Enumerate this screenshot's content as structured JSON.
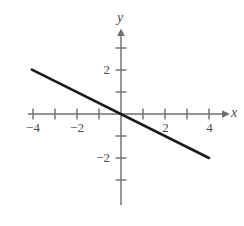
{
  "chart_data": {
    "type": "line",
    "title": "",
    "subtitle": "",
    "xlabel": "x",
    "ylabel": "y",
    "xlim": [
      -4.2,
      4.7
    ],
    "ylim": [
      -3.7,
      3.7
    ],
    "grid": false,
    "legend": null,
    "x_ticks": [
      -4,
      -3,
      -2,
      -1,
      1,
      2,
      3,
      4
    ],
    "x_tick_labels": [
      "−4",
      "",
      "−2",
      "",
      "",
      "2",
      "",
      "4"
    ],
    "y_ticks": [
      -3,
      -2,
      -1,
      1,
      2,
      3
    ],
    "y_tick_labels": [
      "",
      "−2",
      "",
      "",
      "2",
      ""
    ],
    "series": [
      {
        "name": "y = -0.5x",
        "slope": -0.5,
        "intercept": 0,
        "x": [
          -4.05,
          4.0
        ],
        "values": [
          2.02,
          -2.0
        ],
        "color": "#1a1a1a"
      }
    ],
    "axis_color": "#6e6e6e",
    "background": "#ffffff"
  },
  "labels": {
    "x_axis": "x",
    "y_axis": "y",
    "x_neg4": "−4",
    "x_neg2": "−2",
    "x_pos2": "2",
    "x_pos4": "4",
    "y_pos2": "2",
    "y_neg2": "−2"
  }
}
